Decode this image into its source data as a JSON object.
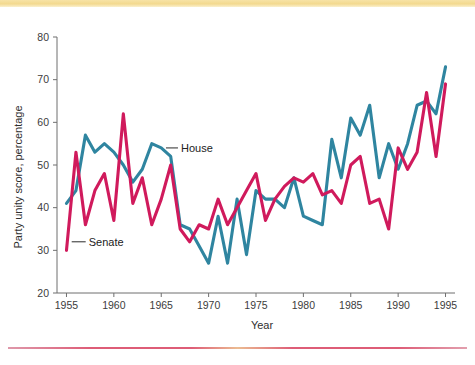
{
  "figure": {
    "background_color": "#ffffff",
    "top_band_color": "#f3d98f",
    "bottom_rule_color": "#d8405f"
  },
  "chart_data": {
    "type": "line",
    "title": "",
    "subtitle": "",
    "xlabel": "Year",
    "ylabel": "Party unity score, percentage",
    "xlim": [
      1954,
      1996
    ],
    "ylim": [
      20,
      80
    ],
    "xticks": [
      1955,
      1960,
      1965,
      1970,
      1975,
      1980,
      1985,
      1990,
      1995
    ],
    "xtick_labels": [
      "1955",
      "1960",
      "1965",
      "1970",
      "1975",
      "1980",
      "1985",
      "1990",
      "1995"
    ],
    "yticks": [
      20,
      30,
      40,
      50,
      60,
      70,
      80
    ],
    "ytick_labels": [
      "20",
      "30",
      "40",
      "50",
      "60",
      "70",
      "80"
    ],
    "grid": false,
    "legend_position": "inline-annotation",
    "x": [
      1955,
      1956,
      1957,
      1958,
      1959,
      1960,
      1961,
      1962,
      1963,
      1964,
      1965,
      1966,
      1967,
      1968,
      1969,
      1970,
      1971,
      1972,
      1973,
      1974,
      1975,
      1976,
      1977,
      1978,
      1979,
      1980,
      1981,
      1982,
      1983,
      1984,
      1985,
      1986,
      1987,
      1988,
      1989,
      1990,
      1991,
      1992,
      1993,
      1994,
      1995
    ],
    "series": [
      {
        "name": "House",
        "color": "#2f85a0",
        "annotation_label": "House",
        "values": [
          41,
          44,
          57,
          53,
          55,
          53,
          50,
          46,
          49,
          55,
          54,
          52,
          36,
          35,
          31,
          27,
          38,
          27,
          42,
          29,
          44,
          42,
          42,
          40,
          47,
          38,
          37,
          36,
          56,
          47,
          61,
          57,
          64,
          47,
          55,
          49,
          55,
          64,
          65,
          62,
          73
        ]
      },
      {
        "name": "Senate",
        "color": "#d01a5c",
        "annotation_label": "Senate",
        "values": [
          30,
          53,
          36,
          44,
          48,
          37,
          62,
          41,
          47,
          36,
          42,
          50,
          35,
          32,
          36,
          35,
          42,
          36,
          40,
          44,
          48,
          37,
          42,
          45,
          47,
          46,
          48,
          43,
          44,
          41,
          50,
          52,
          41,
          42,
          35,
          54,
          49,
          53,
          67,
          52,
          69
        ]
      }
    ],
    "annotations": [
      {
        "text": "House",
        "x": 1965.5,
        "y": 54,
        "points_to_series": "House"
      },
      {
        "text": "Senate",
        "x": 1956.5,
        "y": 32,
        "points_to_series": "Senate"
      }
    ]
  }
}
